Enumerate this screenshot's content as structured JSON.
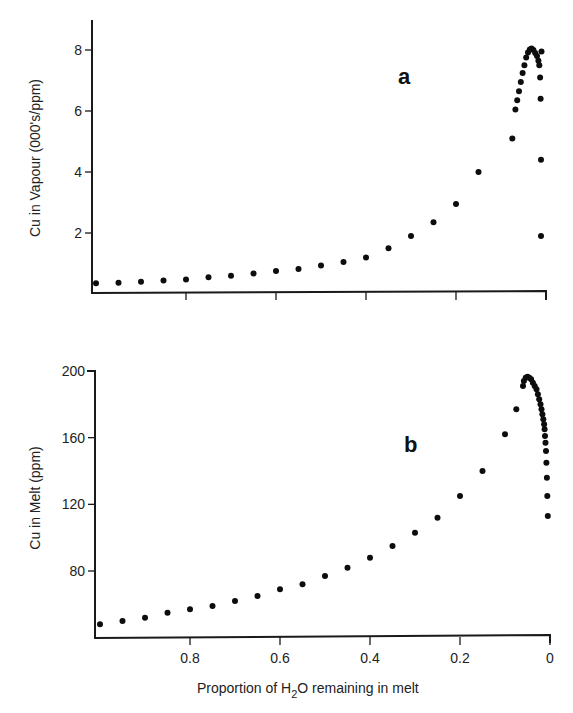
{
  "chart_data": [
    {
      "type": "scatter",
      "panel_label": "a",
      "title": "",
      "xlabel": "Proportion of H2O remaining in melt",
      "ylabel": "Cu in Vapour (000's/ppm)",
      "xlim": [
        1.0,
        0.0
      ],
      "ylim": [
        0,
        9
      ],
      "x_reversed": true,
      "grid": false,
      "xticks": [
        0.8,
        0.6,
        0.4,
        0.2,
        0
      ],
      "xtick_labels": [],
      "yticks": [
        2,
        4,
        6,
        8
      ],
      "ytick_labels": [
        "2",
        "4",
        "6",
        "8"
      ],
      "series": [
        {
          "name": "Cu in Vapour",
          "x": [
            1.0,
            0.95,
            0.9,
            0.85,
            0.8,
            0.75,
            0.7,
            0.65,
            0.6,
            0.55,
            0.5,
            0.45,
            0.4,
            0.35,
            0.3,
            0.25,
            0.2,
            0.15,
            0.075,
            0.068,
            0.064,
            0.06,
            0.056,
            0.052,
            0.048,
            0.044,
            0.04,
            0.036,
            0.032,
            0.028,
            0.024,
            0.02,
            0.017,
            0.015,
            0.013,
            0.012,
            0.011,
            0.011,
            0.01
          ],
          "y": [
            0.35,
            0.37,
            0.4,
            0.44,
            0.48,
            0.55,
            0.6,
            0.67,
            0.75,
            0.82,
            0.93,
            1.05,
            1.2,
            1.5,
            1.9,
            2.35,
            2.95,
            4.0,
            5.1,
            6.05,
            6.35,
            6.65,
            6.95,
            7.25,
            7.5,
            7.75,
            7.92,
            8.02,
            8.05,
            8.0,
            7.9,
            7.8,
            7.65,
            7.5,
            7.1,
            6.4,
            4.4,
            1.9,
            7.95
          ]
        }
      ]
    },
    {
      "type": "scatter",
      "panel_label": "b",
      "title": "",
      "xlabel": "Proportion of H2O remaining in melt",
      "ylabel": "Cu in Melt (ppm)",
      "xlim": [
        1.0,
        0.0
      ],
      "ylim": [
        40,
        200
      ],
      "x_reversed": true,
      "grid": false,
      "xticks": [
        0.8,
        0.6,
        0.4,
        0.2,
        0
      ],
      "xtick_labels": [
        "0.8",
        "0.6",
        "0.4",
        "0.2",
        "0"
      ],
      "yticks": [
        80,
        120,
        160,
        200
      ],
      "ytick_labels": [
        "80",
        "120",
        "160",
        "200"
      ],
      "series": [
        {
          "name": "Cu in Melt",
          "x": [
            1.0,
            0.95,
            0.9,
            0.85,
            0.8,
            0.75,
            0.7,
            0.65,
            0.6,
            0.55,
            0.5,
            0.45,
            0.4,
            0.35,
            0.3,
            0.25,
            0.2,
            0.15,
            0.1,
            0.075,
            0.06,
            0.058,
            0.054,
            0.05,
            0.046,
            0.042,
            0.038,
            0.034,
            0.03,
            0.027,
            0.024,
            0.021,
            0.019,
            0.017,
            0.015,
            0.013,
            0.012,
            0.011,
            0.01,
            0.009,
            0.008,
            0.007,
            0.006,
            0.005
          ],
          "y": [
            48,
            50,
            52,
            55,
            57,
            59,
            62,
            65,
            69,
            72,
            77,
            82,
            88,
            95,
            103,
            112,
            125,
            140,
            162,
            177,
            191,
            194,
            196,
            196.5,
            196,
            195,
            193,
            191,
            189,
            186,
            183,
            180,
            177,
            174,
            171,
            168,
            165,
            161,
            157,
            152,
            145,
            136,
            125,
            113
          ]
        }
      ]
    }
  ],
  "labels": {
    "panel_a": "a",
    "panel_b": "b",
    "ylabel_top": "Cu in Vapour (000's/ppm)",
    "ylabel_bottom": "Cu in Melt (ppm)",
    "xlabel_prefix": "Proportion of H",
    "xlabel_sub": "2",
    "xlabel_suffix": "O remaining in melt"
  }
}
